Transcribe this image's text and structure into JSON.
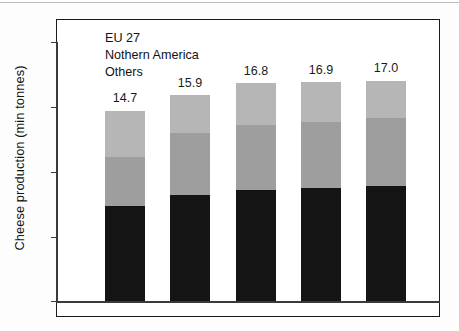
{
  "chart_data": {
    "type": "bar",
    "subtype": "stacked-vertical",
    "title": "",
    "xlabel": "",
    "ylabel": "Cheese production (min tonnes)",
    "categories": [
      "2000",
      "2005",
      "2007",
      "2008",
      "2009"
    ],
    "ylim": [
      0,
      20
    ],
    "yticks": [
      0,
      5,
      10,
      15,
      20
    ],
    "ytick_labels": [
      "0",
      "5",
      "10",
      "15",
      "20"
    ],
    "grid": false,
    "legend_position": "top-left",
    "series": [
      {
        "name": "EU 27",
        "color": "#141414",
        "values": [
          7.3,
          8.2,
          8.6,
          8.7,
          8.9
        ]
      },
      {
        "name": "Nothern America",
        "color": "#9e9e9e",
        "values": [
          3.8,
          4.8,
          5.0,
          5.1,
          5.2
        ]
      },
      {
        "name": "Others",
        "color": "#b6b6b6",
        "values": [
          3.6,
          2.9,
          3.2,
          3.1,
          2.9
        ]
      }
    ],
    "totals": [
      14.7,
      15.9,
      16.8,
      16.9,
      17.0
    ],
    "data_labels": [
      "14.7",
      "15.9",
      "16.8",
      "16.9",
      "17.0"
    ]
  },
  "legend": {
    "items": [
      {
        "label": "EU 27",
        "color": "#141414"
      },
      {
        "label": "Nothern America",
        "color": "#9e9e9e"
      },
      {
        "label": "Others",
        "color": "#b6b6b6"
      }
    ]
  },
  "axis": {
    "y_title": "Cheese production (min tonnes)",
    "y_labels": [
      "20",
      "15",
      "10",
      "5",
      "0"
    ],
    "x_labels": [
      "2000",
      "2005",
      "2007",
      "2008",
      "2009"
    ]
  },
  "bars": [
    {
      "category": "2000",
      "total_label": "14.7",
      "eu": 7.3,
      "na": 3.8,
      "others": 3.6
    },
    {
      "category": "2005",
      "total_label": "15.9",
      "eu": 8.2,
      "na": 4.8,
      "others": 2.9
    },
    {
      "category": "2007",
      "total_label": "16.8",
      "eu": 8.6,
      "na": 5.0,
      "others": 3.2
    },
    {
      "category": "2008",
      "total_label": "16.9",
      "eu": 8.7,
      "na": 5.1,
      "others": 3.1
    },
    {
      "category": "2009",
      "total_label": "17.0",
      "eu": 8.9,
      "na": 5.2,
      "others": 2.9
    }
  ]
}
